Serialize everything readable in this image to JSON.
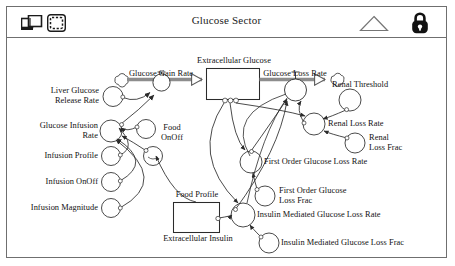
{
  "window": {
    "title": "Glucose Sector"
  },
  "toolbar": {
    "icons": [
      {
        "name": "window-icon",
        "label": "window"
      },
      {
        "name": "select-region-icon",
        "label": "select region"
      },
      {
        "name": "triangle-icon",
        "label": "triangle"
      },
      {
        "name": "lock-icon",
        "label": "lock"
      }
    ]
  },
  "diagram": {
    "type": "system-dynamics-stock-flow",
    "stocks": [
      {
        "name": "extracellular-glucose",
        "label": "Extracellular Glucose"
      },
      {
        "name": "extracellular-insulin",
        "label": "Extracellular Insulin"
      }
    ],
    "flows": [
      {
        "name": "glucose-gain-rate",
        "label": "Glucose Gain Rate"
      },
      {
        "name": "glucose-loss-rate",
        "label": "Glucose Loss Rate"
      }
    ],
    "variables": [
      {
        "name": "liver-glucose-release-rate",
        "label": "Liver Glucose\nRelease Rate"
      },
      {
        "name": "glucose-infusion-rate",
        "label": "Glucose Infusion\nRate"
      },
      {
        "name": "infusion-profile",
        "label": "Infusion Profile"
      },
      {
        "name": "infusion-onoff",
        "label": "Infusion OnOff"
      },
      {
        "name": "infusion-magnitude",
        "label": "Infusion Magnitude"
      },
      {
        "name": "food-onoff",
        "label": "Food\nOnOff"
      },
      {
        "name": "food-profile",
        "label": "Food Profile"
      },
      {
        "name": "renal-threshold",
        "label": "Renal Threshold"
      },
      {
        "name": "renal-loss-rate",
        "label": "Renal Loss Rate"
      },
      {
        "name": "renal-loss-frac",
        "label": "Renal\nLoss Frac"
      },
      {
        "name": "first-order-glucose-loss-rate",
        "label": "First Order Glucose Loss Rate"
      },
      {
        "name": "first-order-glucose-loss-frac",
        "label": "First Order Glucose\nLoss Frac"
      },
      {
        "name": "insulin-mediated-glucose-loss-rate",
        "label": "Insulin Mediated Glucose Loss Rate"
      },
      {
        "name": "insulin-mediated-glucose-loss-frac",
        "label": "Insulin Mediated Glucose Loss Frac"
      }
    ],
    "labels": {
      "extracellular_glucose": "Extracellular Glucose",
      "extracellular_insulin": "Extracellular Insulin",
      "glucose_gain_rate": "Glucose Gain Rate",
      "glucose_loss_rate": "Glucose Loss Rate",
      "liver_glucose_release_rate_l1": "Liver Glucose",
      "liver_glucose_release_rate_l2": "Release Rate",
      "glucose_infusion_rate_l1": "Glucose Infusion",
      "glucose_infusion_rate_l2": "Rate",
      "infusion_profile": "Infusion Profile",
      "infusion_onoff": "Infusion OnOff",
      "infusion_magnitude": "Infusion Magnitude",
      "food_onoff_l1": "Food",
      "food_onoff_l2": "OnOff",
      "food_profile": "Food Profile",
      "renal_threshold": "Renal Threshold",
      "renal_loss_rate": "Renal Loss Rate",
      "renal_loss_frac_l1": "Renal",
      "renal_loss_frac_l2": "Loss Frac",
      "first_order_glucose_loss_rate": "First Order Glucose Loss Rate",
      "first_order_glucose_loss_frac_l1": "First Order Glucose",
      "first_order_glucose_loss_frac_l2": "Loss Frac",
      "insulin_mediated_glucose_loss_rate": "Insulin Mediated Glucose Loss Rate",
      "insulin_mediated_glucose_loss_frac": "Insulin Mediated Glucose Loss Frac"
    }
  },
  "colors": {
    "frame": "#6f6f6f",
    "stroke": "#2b2b2b",
    "flow_pipe": "#8d8d8d",
    "text": "#111111",
    "background": "#ffffff"
  }
}
